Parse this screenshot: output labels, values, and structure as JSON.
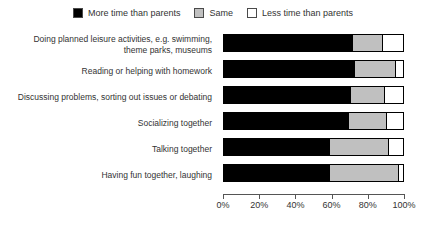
{
  "chart_data": {
    "type": "bar",
    "subtype": "stacked-horizontal-100",
    "title": "",
    "xlabel": "",
    "ylabel": "",
    "xlim": [
      0,
      100
    ],
    "grid": false,
    "legend_position": "top-center",
    "axis_tick_labels": [
      "0%",
      "20%",
      "40%",
      "60%",
      "80%",
      "100%"
    ],
    "axis_tick_values": [
      0,
      20,
      40,
      60,
      80,
      100
    ],
    "categories": [
      "Doing planned leisure activities, e.g. swimming, theme parks, museums",
      "Reading or helping with homework",
      "Discussing problems, sorting out issues or debating",
      "Socializing together",
      "Talking together",
      "Having fun together, laughing"
    ],
    "series": [
      {
        "name": "More time than parents",
        "color": "#000000",
        "values": [
          72,
          73,
          71,
          70,
          59,
          59
        ]
      },
      {
        "name": "Same",
        "color": "#c0c0c0",
        "values": [
          17,
          23,
          19,
          21,
          33,
          39
        ]
      },
      {
        "name": "Less time than parents",
        "color": "#ffffff",
        "values": [
          11,
          4,
          10,
          9,
          8,
          2
        ]
      }
    ]
  },
  "legend": {
    "items": [
      {
        "label": "More time than parents",
        "color": "#000000"
      },
      {
        "label": "Same",
        "color": "#c0c0c0"
      },
      {
        "label": "Less time than parents",
        "color": "#ffffff"
      }
    ]
  },
  "categories_display": [
    {
      "line1": "Doing planned leisure activities, e.g. swimming,",
      "line2": "theme parks, museums"
    },
    {
      "line1": "Reading or helping with homework",
      "line2": ""
    },
    {
      "line1": "Discussing problems, sorting out issues or debating",
      "line2": ""
    },
    {
      "line1": "Socializing together",
      "line2": ""
    },
    {
      "line1": "Talking together",
      "line2": ""
    },
    {
      "line1": "Having fun together, laughing",
      "line2": ""
    }
  ],
  "axis": {
    "ticks": [
      {
        "label": "0%"
      },
      {
        "label": "20%"
      },
      {
        "label": "40%"
      },
      {
        "label": "60%"
      },
      {
        "label": "80%"
      },
      {
        "label": "100%"
      }
    ]
  }
}
